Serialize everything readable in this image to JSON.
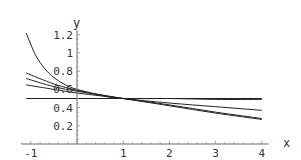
{
  "chart_data": {
    "type": "line",
    "title": "",
    "xlabel": "x",
    "ylabel": "y",
    "xlim": [
      -1.1,
      4.2
    ],
    "ylim": [
      0,
      1.25
    ],
    "grid": false,
    "legend": null,
    "x_ticks": [
      -1,
      1,
      2,
      3,
      4
    ],
    "x_tick_labels": [
      "-1",
      "1",
      "2",
      "3",
      "4"
    ],
    "y_ticks": [
      0.2,
      0.4,
      0.6,
      0.8,
      1.0,
      1.2
    ],
    "y_tick_labels": [
      "0.2",
      "0.4",
      "0.6",
      "0.8",
      "1",
      "1.2"
    ],
    "series": [
      {
        "name": "curve-flat",
        "x": [
          -1.1,
          4
        ],
        "values": [
          0.5,
          0.5
        ]
      },
      {
        "name": "curve-steep",
        "x": [
          -1.1,
          -0.9,
          -0.7,
          -0.5,
          -0.25,
          0,
          0.5,
          1,
          2,
          3,
          4
        ],
        "values": [
          1.22,
          0.98,
          0.83,
          0.73,
          0.65,
          0.6,
          0.54,
          0.5,
          0.45,
          0.41,
          0.37
        ]
      },
      {
        "name": "curve-2",
        "x": [
          -1.1,
          -0.5,
          0,
          0.5,
          1,
          2,
          3,
          4
        ],
        "values": [
          0.78,
          0.66,
          0.59,
          0.54,
          0.5,
          0.42,
          0.34,
          0.27
        ]
      },
      {
        "name": "curve-3",
        "x": [
          -1.1,
          -0.5,
          0,
          0.5,
          1,
          2,
          3,
          4
        ],
        "values": [
          0.72,
          0.63,
          0.58,
          0.54,
          0.5,
          0.43,
          0.35,
          0.28
        ]
      },
      {
        "name": "curve-4",
        "x": [
          -1.1,
          -0.5,
          0,
          0.5,
          1,
          2,
          3,
          4
        ],
        "values": [
          0.65,
          0.6,
          0.56,
          0.53,
          0.5,
          0.5,
          0.49,
          0.49
        ]
      }
    ]
  }
}
